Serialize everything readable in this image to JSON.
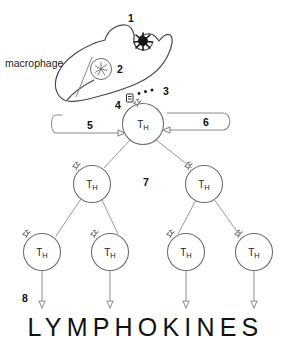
{
  "figure": {
    "title_text": "LYMPHOKINES",
    "macrophage_label": "macrophage",
    "cell_label": "T",
    "cell_label_sub": "H",
    "callouts": [
      {
        "id": "1",
        "label": "1",
        "meaning": "antigen"
      },
      {
        "id": "2",
        "label": "2",
        "meaning": "macrophage-nucleus"
      },
      {
        "id": "3",
        "label": "3",
        "meaning": "processed-antigen-fragments"
      },
      {
        "id": "4",
        "label": "4",
        "meaning": "mhc-antigen-presentation"
      },
      {
        "id": "5",
        "label": "5",
        "meaning": "interleukin-1-signal"
      },
      {
        "id": "6",
        "label": "6",
        "meaning": "interleukin-2-autocrine-loop"
      },
      {
        "id": "7",
        "label": "7",
        "meaning": "clonal-proliferation"
      },
      {
        "id": "8",
        "label": "8",
        "meaning": "lymphokine-secretion"
      }
    ],
    "cells": [
      {
        "row": 1,
        "index": 0,
        "name": "helper-t-cell-parent"
      },
      {
        "row": 2,
        "index": 0,
        "name": "helper-t-cell-left"
      },
      {
        "row": 2,
        "index": 1,
        "name": "helper-t-cell-right"
      },
      {
        "row": 3,
        "index": 0,
        "name": "helper-t-cell-1"
      },
      {
        "row": 3,
        "index": 1,
        "name": "helper-t-cell-2"
      },
      {
        "row": 3,
        "index": 2,
        "name": "helper-t-cell-3"
      },
      {
        "row": 3,
        "index": 3,
        "name": "helper-t-cell-4"
      }
    ],
    "colors": {
      "ink": "#111111",
      "outline": "#6e6e6e",
      "macrophage_outline": "#4a4a4a",
      "antigen": "#151515",
      "connector": "#9a9a9a",
      "background": "#ffffff"
    }
  }
}
